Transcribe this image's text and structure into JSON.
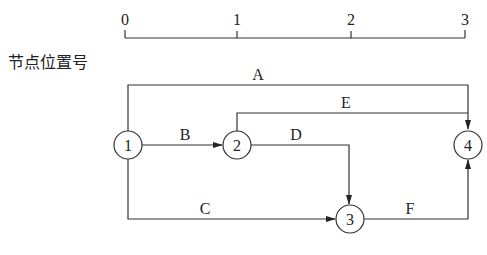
{
  "diagram": {
    "type": "activity-on-arrow network (time-scaled)",
    "axis": {
      "label": "节点位置号",
      "ticks": [
        "0",
        "1",
        "2",
        "3"
      ]
    },
    "nodes": [
      {
        "id": "1",
        "label": "1",
        "position": 0
      },
      {
        "id": "2",
        "label": "2",
        "position": 1
      },
      {
        "id": "3",
        "label": "3",
        "position": 2
      },
      {
        "id": "4",
        "label": "4",
        "position": 3
      }
    ],
    "activities": [
      {
        "label": "A",
        "from": "1",
        "to": "4"
      },
      {
        "label": "B",
        "from": "1",
        "to": "2"
      },
      {
        "label": "C",
        "from": "1",
        "to": "3"
      },
      {
        "label": "D",
        "from": "2",
        "to": "3"
      },
      {
        "label": "E",
        "from": "2",
        "to": "4"
      },
      {
        "label": "F",
        "from": "3",
        "to": "4"
      }
    ]
  }
}
